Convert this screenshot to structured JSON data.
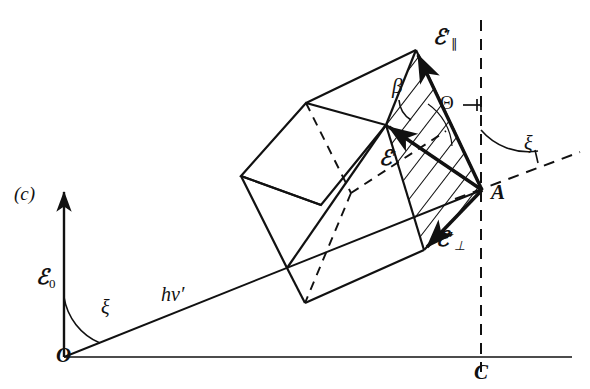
{
  "figure": {
    "panel_label": "(c)",
    "stroke_color": "#111111",
    "background": "#ffffff"
  },
  "labels": {
    "panel": "(c)",
    "epsilon_zero_sym": "ℰ",
    "epsilon_zero_sub": "0",
    "origin": "O",
    "point_a": "A",
    "point_c": "C",
    "xi_lower": "ξ",
    "xi_upper": "ξ",
    "h_nu_prime": "hν′",
    "epsilon_par_sym": "ℰ",
    "epsilon_par_prime": "′",
    "epsilon_par_sub": "∥",
    "epsilon_perp_sym": "ℰ",
    "epsilon_perp_prime": "′",
    "epsilon_perp_sub": "⊥",
    "epsilon_prime_sym": "ℰ",
    "epsilon_prime_mark": "′",
    "beta": "β",
    "theta": "Θ"
  },
  "geometry": {
    "origin": [
      64,
      357
    ],
    "point_a": [
      482,
      190
    ],
    "point_c": [
      482,
      357
    ],
    "vertical_axis_top": [
      64,
      186
    ],
    "horizontal_axis_right": [
      572,
      357
    ],
    "dashed_vertical_top": [
      481,
      20
    ],
    "dashed_vertical_bottom": [
      481,
      372
    ],
    "dashed_diagonal_end": [
      580,
      152
    ],
    "cube_front_top": [
      306,
      103
    ],
    "cube_front_left": [
      241,
      176
    ],
    "cube_front_bottom": [
      287,
      268
    ],
    "cube_top_apex": [
      416,
      50
    ],
    "cube_mid_left": [
      386,
      125
    ],
    "cube_bottom_back": [
      305,
      303
    ],
    "epsilon_perp_tip": [
      424,
      250
    ],
    "hatch_spacing_px": 13
  }
}
